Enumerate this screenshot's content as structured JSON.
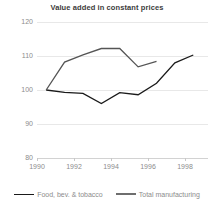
{
  "chart_data": {
    "type": "line",
    "title": "Value added in constant prices",
    "xlabel": "",
    "ylabel": "",
    "xlim": [
      1989.5,
      1998.8
    ],
    "ylim": [
      80,
      120
    ],
    "yticks": [
      80,
      90,
      100,
      110,
      120
    ],
    "xticks": [
      1990,
      1992,
      1994,
      1996,
      1998
    ],
    "grid": true,
    "legend_position": "bottom",
    "series": [
      {
        "name": "Food, bev. & tobacco",
        "color": "#1a1a1a",
        "x": [
          1990,
          1991,
          1992,
          1993,
          1994,
          1995,
          1996,
          1997,
          1998
        ],
        "values": [
          100.0,
          99.3,
          99.0,
          96.0,
          99.2,
          98.6,
          102.0,
          108.0,
          110.3
        ]
      },
      {
        "name": "Total manufacturing",
        "color": "#555555",
        "x": [
          1990,
          1991,
          1992,
          1993,
          1994,
          1995,
          1996
        ],
        "values": [
          100.0,
          108.2,
          110.3,
          112.2,
          112.2,
          106.8,
          108.4
        ]
      }
    ]
  },
  "axis": {
    "y_tick_labels": [
      "120",
      "110",
      "100",
      "90",
      "80"
    ],
    "x_tick_labels": [
      "1990",
      "1992",
      "1994",
      "1996",
      "1998"
    ]
  },
  "legend": {
    "entries": [
      {
        "label": "Food, bev. & tobacco"
      },
      {
        "label": "Total manufacturing"
      }
    ]
  }
}
